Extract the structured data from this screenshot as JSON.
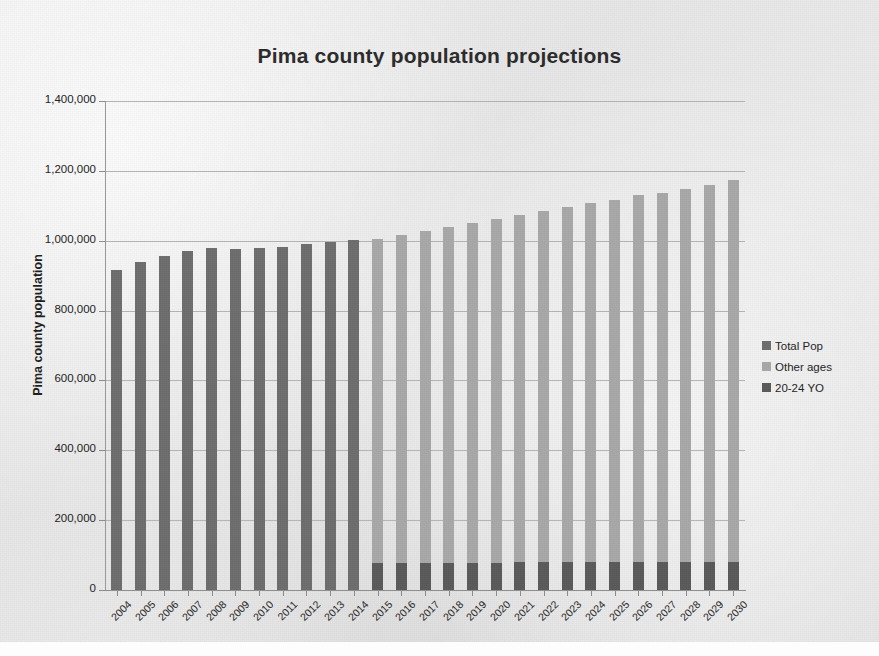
{
  "chart_data": {
    "type": "bar",
    "subtype": "stacked-column",
    "title": "Pima county population projections",
    "xlabel": "",
    "ylabel": "Pima county population",
    "ylim": [
      0,
      1400000
    ],
    "ytick_values": [
      0,
      200000,
      400000,
      600000,
      800000,
      1000000,
      1200000,
      1400000
    ],
    "ytick_labels": [
      "0",
      "200,000",
      "400,000",
      "600,000",
      "800,000",
      "1,000,000",
      "1,200,000",
      "1,400,000"
    ],
    "grid": true,
    "legend_position": "right",
    "categories": [
      "2004",
      "2005",
      "2006",
      "2007",
      "2008",
      "2009",
      "2010",
      "2011",
      "2012",
      "2013",
      "2014",
      "2015",
      "2016",
      "2017",
      "2018",
      "2019",
      "2020",
      "2021",
      "2022",
      "2023",
      "2024",
      "2025",
      "2026",
      "2027",
      "2028",
      "2029",
      "2030"
    ],
    "series": [
      {
        "name": "Total Pop",
        "color": "#6e6e6e",
        "values": [
          915000,
          940000,
          955000,
          972000,
          978000,
          977000,
          978000,
          982000,
          990000,
          997000,
          1002000,
          null,
          null,
          null,
          null,
          null,
          null,
          null,
          null,
          null,
          null,
          null,
          null,
          null,
          null,
          null,
          null
        ]
      },
      {
        "name": "Other ages",
        "color": "#a9a9a9",
        "values": [
          null,
          null,
          null,
          null,
          null,
          null,
          null,
          null,
          null,
          null,
          null,
          928000,
          939000,
          950000,
          960000,
          972000,
          984000,
          995000,
          1007000,
          1018000,
          1028000,
          1038000,
          1050000,
          1057000,
          1066000,
          1078000,
          1092000
        ]
      },
      {
        "name": "20-24 YO",
        "color": "#5a5a5a",
        "values": [
          null,
          null,
          null,
          null,
          null,
          null,
          null,
          null,
          null,
          null,
          null,
          78000,
          78000,
          78000,
          78000,
          78000,
          78000,
          79000,
          79000,
          79000,
          80000,
          80000,
          80000,
          80000,
          81000,
          81000,
          81000
        ]
      }
    ],
    "stack_totals": [
      915000,
      940000,
      955000,
      972000,
      978000,
      977000,
      978000,
      982000,
      990000,
      997000,
      1002000,
      1006000,
      1017000,
      1028000,
      1038000,
      1050000,
      1062000,
      1074000,
      1086000,
      1097000,
      1108000,
      1118000,
      1130000,
      1137000,
      1147000,
      1159000,
      1173000
    ]
  },
  "legend": {
    "entries": [
      {
        "label": "Total Pop",
        "color": "#6e6e6e"
      },
      {
        "label": "Other ages",
        "color": "#a9a9a9"
      },
      {
        "label": "20-24 YO",
        "color": "#5a5a5a"
      }
    ]
  },
  "colors": {
    "total_pop": "#6e6e6e",
    "other_ages": "#a9a9a9",
    "young_adults": "#5a5a5a",
    "gridline": "#b6b6b6",
    "axis": "#8e8e8e",
    "text": "#1f1f1f",
    "page_background": "#ebebeb"
  }
}
